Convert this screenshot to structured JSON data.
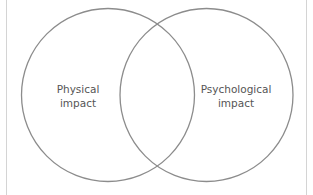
{
  "diagram": {
    "type": "venn",
    "sets": [
      {
        "id": "physical",
        "label_line1": "Physical",
        "label_line2": "impact"
      },
      {
        "id": "psychological",
        "label_line1": "Psychological",
        "label_line2": "impact"
      }
    ],
    "colors": {
      "circle_stroke": "#8c8c8c",
      "text": "#555555",
      "frame": "#d4d4d4",
      "background": "#ffffff"
    }
  }
}
